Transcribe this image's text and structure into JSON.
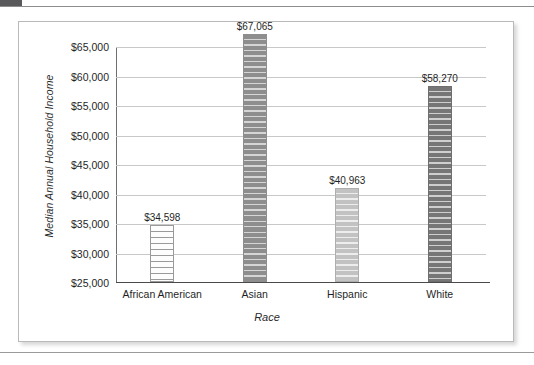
{
  "chart_data": {
    "type": "bar",
    "title": "",
    "xlabel": "Race",
    "ylabel": "Median Annual Household Income",
    "categories": [
      "African American",
      "Asian",
      "Hispanic",
      "White"
    ],
    "values": [
      34598,
      67065,
      40963,
      58270
    ],
    "value_labels": [
      "$34,598",
      "$67,065",
      "$40,963",
      "$58,270"
    ],
    "ylim": [
      25000,
      65000
    ],
    "ytick_labels": [
      "$25,000",
      "$30,000",
      "$35,000",
      "$40,000",
      "$45,000",
      "$50,000",
      "$55,000",
      "$60,000",
      "$65,000"
    ],
    "ytick_values": [
      25000,
      30000,
      35000,
      40000,
      45000,
      50000,
      55000,
      60000,
      65000
    ],
    "grid": true,
    "legend": false,
    "legend_position": "none",
    "bar_fills": [
      "light-horizontal-stripes",
      "medium-dark-horizontal-stripes",
      "light-gray-horizontal-stripes",
      "dark-gray-horizontal-stripes"
    ],
    "colors": {
      "bar_african_american": "#fdfdfd",
      "bar_asian": "#8e8e8e",
      "bar_hispanic": "#c2c2c2",
      "bar_white": "#767676",
      "gridline": "#c8c8c8",
      "axis": "#4a4a4a",
      "text": "#1f1f1f"
    }
  }
}
